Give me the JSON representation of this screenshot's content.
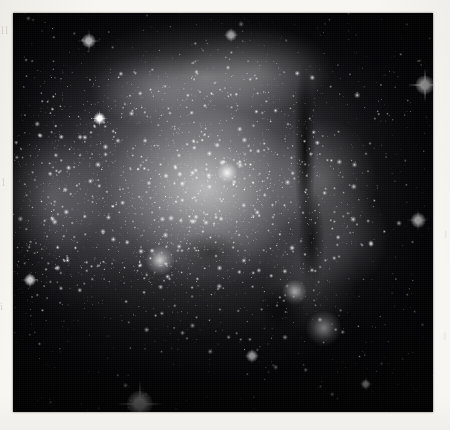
{
  "page": {
    "background_color": "#f7f6f2",
    "medium": "scanned grayscale photographic plate"
  },
  "plate": {
    "name": "astronomical-plate",
    "x": 13,
    "y": 13,
    "width": 420,
    "height": 399,
    "background_color": "#000000",
    "palette": {
      "sky": "#06060a",
      "nebula_mid": "#6e6e72",
      "nebula_bright": "#c4c4c4",
      "star": "#ffffff",
      "dust": "#000000",
      "paper": "#f7f6f2"
    }
  },
  "margin_marks": {
    "left_top": "ll",
    "left_mid": "l",
    "left_low": "i",
    "right_mid": "‖",
    "right_low": "‖"
  },
  "scene": {
    "subject": "emission nebula with embedded open star cluster",
    "features": [
      {
        "name": "central-star-cluster",
        "label": "central star cluster",
        "cx_pct": 51,
        "cy_pct": 47,
        "brightness": "very bright"
      },
      {
        "name": "secondary-cluster-knot",
        "label": "secondary cluster knot",
        "cx_pct": 35,
        "cy_pct": 62,
        "brightness": "bright"
      },
      {
        "name": "nebula-knot-upper-right",
        "label": "bright nebular knot",
        "cx_pct": 67,
        "cy_pct": 70,
        "brightness": "bright"
      },
      {
        "name": "nebula-knot-lower-right",
        "label": "bright nebular knot",
        "cx_pct": 74,
        "cy_pct": 79,
        "brightness": "bright"
      },
      {
        "name": "dust-lane",
        "label": "dark dust lane",
        "cx_pct": 70,
        "cy_pct": 38,
        "brightness": "dark absorption"
      },
      {
        "name": "dense-star-swarm-left",
        "label": "dense background star swarm",
        "cx_pct": 10,
        "cy_pct": 47,
        "brightness": "moderate"
      },
      {
        "name": "nebula-rim-arc",
        "label": "upper nebula rim arc",
        "cx_pct": 47,
        "cy_pct": 16,
        "brightness": "moderate"
      }
    ],
    "bright_stars": [
      {
        "name": "spike-star-bottom",
        "x_pct": 30.2,
        "y_pct": 98.0,
        "size": 11,
        "spike": 46
      },
      {
        "name": "spike-star-upper-right",
        "x_pct": 98.0,
        "y_pct": 18.0,
        "size": 8,
        "spike": 34
      },
      {
        "name": "spike-star-upper-left",
        "x_pct": 18.0,
        "y_pct": 7.0,
        "size": 6,
        "spike": 24
      },
      {
        "name": "spike-star-right-edge",
        "x_pct": 96.5,
        "y_pct": 52.0,
        "size": 6,
        "spike": 22
      },
      {
        "name": "spike-star-lower-left",
        "x_pct": 4.0,
        "y_pct": 67.0,
        "size": 5,
        "spike": 18
      },
      {
        "name": "spike-star-mid-left",
        "x_pct": 20.5,
        "y_pct": 26.5,
        "size": 5,
        "spike": 17
      },
      {
        "name": "spike-star-top-mid",
        "x_pct": 52.0,
        "y_pct": 5.5,
        "size": 5,
        "spike": 16
      },
      {
        "name": "spike-star-lower-mid",
        "x_pct": 57.0,
        "y_pct": 86.0,
        "size": 5,
        "spike": 16
      },
      {
        "name": "spike-star-bottom-right",
        "x_pct": 84.0,
        "y_pct": 93.0,
        "size": 4,
        "spike": 14
      }
    ]
  }
}
